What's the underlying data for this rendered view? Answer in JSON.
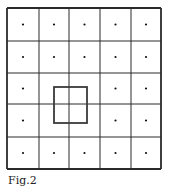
{
  "figure": {
    "caption": "Fig.2",
    "grid": {
      "rows": 5,
      "cols": 5,
      "x_lines": [
        7,
        39,
        69,
        100,
        131,
        161
      ],
      "y_lines": [
        8,
        41,
        73,
        104,
        137,
        169
      ],
      "line_color": "#2a2a2a",
      "dot_color": "#111111"
    },
    "dots": [
      [
        1,
        1,
        1,
        1,
        1
      ],
      [
        1,
        1,
        1,
        1,
        1
      ],
      [
        1,
        0,
        0,
        1,
        1
      ],
      [
        1,
        0,
        0,
        1,
        1
      ],
      [
        1,
        1,
        1,
        1,
        1
      ]
    ],
    "highlight_square": {
      "x": 54,
      "y": 87,
      "width": 33,
      "height": 36,
      "color": "#3a3a3a"
    }
  }
}
